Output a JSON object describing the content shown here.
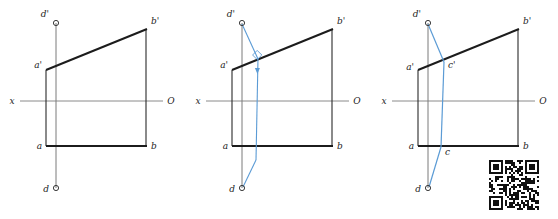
{
  "figure": {
    "type": "descriptive-geometry-construction",
    "panel_count": 3,
    "colors": {
      "outline": "#1c1c1c",
      "axis": "#8a8a8a",
      "projector": "#6f6f6f",
      "construction": "#5b9bd5",
      "label": "#1c1c1c"
    }
  },
  "panels": [
    {
      "id": "panel-1",
      "name": "given-line-and-point",
      "axis": {
        "left_label": "x",
        "right_label": "O"
      },
      "labels": {
        "a_prime": "a'",
        "b_prime": "b'",
        "d_prime": "d'",
        "a": "a",
        "b": "b",
        "d": "d"
      }
    },
    {
      "id": "panel-2",
      "name": "perpendicular-construction",
      "axis": {
        "left_label": "x",
        "right_label": "O"
      },
      "labels": {
        "a_prime": "a'",
        "b_prime": "b'",
        "d_prime": "d'",
        "a": "a",
        "b": "b",
        "d": "d"
      },
      "marks": {
        "right_angle": "right-angle-square",
        "direction_arrow": "down-arrow"
      }
    },
    {
      "id": "panel-3",
      "name": "foot-of-perpendicular-result",
      "axis": {
        "left_label": "x",
        "right_label": "O"
      },
      "labels": {
        "a_prime": "a'",
        "b_prime": "b'",
        "d_prime": "d'",
        "c_prime": "c'",
        "a": "a",
        "b": "b",
        "d": "d",
        "c": "c"
      }
    }
  ],
  "qr_code": {
    "name": "qr-code",
    "present": true
  }
}
